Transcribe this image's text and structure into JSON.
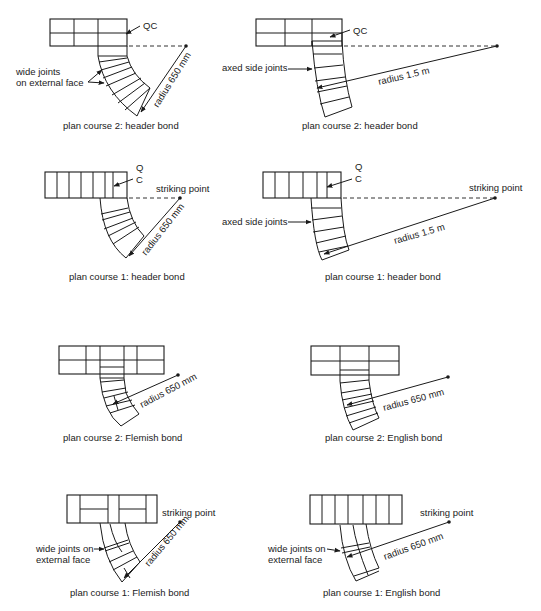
{
  "figure": {
    "panels": [
      {
        "id": "p1",
        "caption": "plan course 2: header bond",
        "labels": {
          "qc": "QC",
          "joints": [
            "wide joints",
            "on external face"
          ],
          "radius": "radius 650 mm"
        }
      },
      {
        "id": "p2",
        "caption": "plan course 2: header bond",
        "labels": {
          "qc": "QC",
          "joints": "axed side joints",
          "radius": "radius 1.5 m"
        }
      },
      {
        "id": "p3",
        "caption": "plan course 1: header bond",
        "labels": {
          "q": "Q",
          "c": "C",
          "striking": "striking point",
          "radius": "radius 650 mm"
        }
      },
      {
        "id": "p4",
        "caption": "plan course 1: header bond",
        "labels": {
          "q": "Q",
          "c": "C",
          "striking": "striking point",
          "joints": "axed side joints",
          "radius": "radius 1.5 m"
        }
      },
      {
        "id": "p5",
        "caption": "plan course 2: Flemish bond",
        "labels": {
          "radius": "radius 650 mm"
        }
      },
      {
        "id": "p6",
        "caption": "plan course 2: English bond",
        "labels": {
          "radius": "radius 650 mm"
        }
      },
      {
        "id": "p7",
        "caption": "plan course 1: Flemish bond",
        "labels": {
          "striking": "striking point",
          "joints": [
            "wide joints on",
            "external face"
          ],
          "radius": "radius 650 mm"
        }
      },
      {
        "id": "p8",
        "caption": "plan course 1: English bond",
        "labels": {
          "striking": "striking point",
          "joints": [
            "wide joints on",
            "external face"
          ],
          "radius": "radius 650 mm"
        }
      }
    ]
  }
}
